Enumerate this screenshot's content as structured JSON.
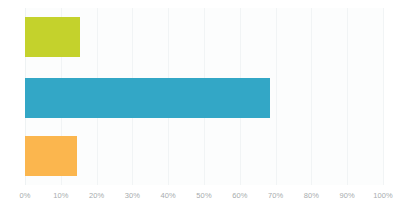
{
  "chart_data": {
    "type": "bar",
    "orientation": "horizontal",
    "title": "",
    "subtitle": "",
    "xlabel": "",
    "ylabel": "",
    "categories": [
      "",
      "",
      ""
    ],
    "values": [
      15.5,
      68.5,
      14.5
    ],
    "series": [
      {
        "name": "",
        "values": [
          15.5,
          68.5,
          14.5
        ]
      }
    ],
    "value_format": "percent",
    "xlim": [
      0,
      100
    ],
    "xticks": [
      0,
      10,
      20,
      30,
      40,
      50,
      60,
      70,
      80,
      90,
      100
    ],
    "xtick_labels": [
      "0%",
      "10%",
      "20%",
      "30%",
      "40%",
      "50%",
      "60%",
      "70%",
      "80%",
      "90%",
      "100%"
    ],
    "grid": true,
    "grid_axis": "x",
    "legend": false,
    "legend_position": "none",
    "annotations": [],
    "bar_colors": [
      "#c4d22c",
      "#33a7c6",
      "#fbb64e"
    ],
    "colors": {
      "background": "#ffffff",
      "plot_background": "#fcfdfd",
      "gridline": "#f1f4f5",
      "tick_label": "#a7acae",
      "bar_green": "#c4d22c",
      "bar_blue": "#33a7c6",
      "bar_orange": "#fbb64e"
    },
    "bars": [
      {
        "name": "bar-green",
        "value": 15.5,
        "value_label": "15.5%",
        "color": "#c4d22c"
      },
      {
        "name": "bar-blue",
        "value": 68.5,
        "value_label": "68.5%",
        "color": "#33a7c6"
      },
      {
        "name": "bar-orange",
        "value": 14.5,
        "value_label": "14.5%",
        "color": "#fbb64e"
      }
    ]
  }
}
